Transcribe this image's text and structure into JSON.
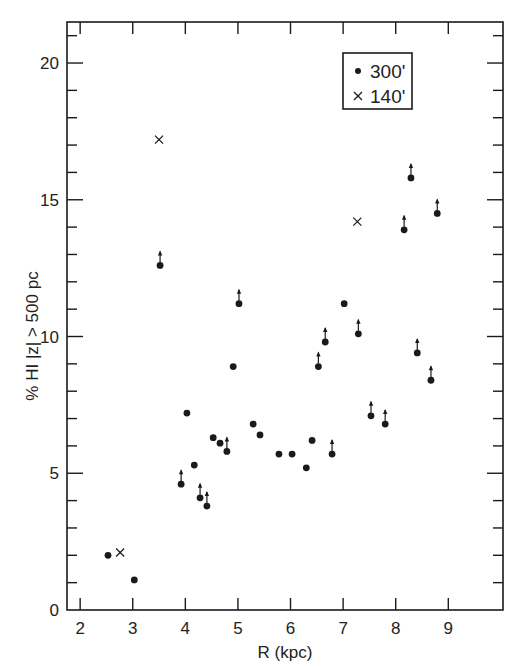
{
  "chart_data": {
    "type": "scatter",
    "title": "",
    "xlabel": "R (kpc)",
    "ylabel": "% HI |z| > 500 pc",
    "xlim": [
      1.75,
      10.04
    ],
    "ylim": [
      0,
      21.5
    ],
    "xticks": [
      2,
      3,
      4,
      5,
      6,
      7,
      8,
      9
    ],
    "yticks_major": [
      0,
      5,
      10,
      15,
      20
    ],
    "yticks_minor_step": 1,
    "grid": false,
    "legend_position": "upper right (inside)",
    "series": [
      {
        "name": "300'",
        "marker": "filled-circle",
        "points": [
          {
            "x": 2.53,
            "y": 2.0,
            "lower_limit": false
          },
          {
            "x": 3.03,
            "y": 1.1,
            "lower_limit": false
          },
          {
            "x": 3.52,
            "y": 12.6,
            "lower_limit": true
          },
          {
            "x": 3.92,
            "y": 4.6,
            "lower_limit": true
          },
          {
            "x": 4.03,
            "y": 7.2,
            "lower_limit": false
          },
          {
            "x": 4.17,
            "y": 5.3,
            "lower_limit": false
          },
          {
            "x": 4.28,
            "y": 4.1,
            "lower_limit": true
          },
          {
            "x": 4.41,
            "y": 3.8,
            "lower_limit": true
          },
          {
            "x": 4.53,
            "y": 6.3,
            "lower_limit": false
          },
          {
            "x": 4.66,
            "y": 6.1,
            "lower_limit": false
          },
          {
            "x": 4.79,
            "y": 5.8,
            "lower_limit": true
          },
          {
            "x": 4.91,
            "y": 8.9,
            "lower_limit": false
          },
          {
            "x": 5.02,
            "y": 11.2,
            "lower_limit": true
          },
          {
            "x": 5.29,
            "y": 6.8,
            "lower_limit": false
          },
          {
            "x": 5.42,
            "y": 6.4,
            "lower_limit": false
          },
          {
            "x": 5.78,
            "y": 5.7,
            "lower_limit": false
          },
          {
            "x": 6.03,
            "y": 5.7,
            "lower_limit": false
          },
          {
            "x": 6.3,
            "y": 5.2,
            "lower_limit": false
          },
          {
            "x": 6.41,
            "y": 6.2,
            "lower_limit": false
          },
          {
            "x": 6.53,
            "y": 8.9,
            "lower_limit": true
          },
          {
            "x": 6.66,
            "y": 9.8,
            "lower_limit": true
          },
          {
            "x": 6.79,
            "y": 5.7,
            "lower_limit": true
          },
          {
            "x": 7.02,
            "y": 11.2,
            "lower_limit": false
          },
          {
            "x": 7.29,
            "y": 10.1,
            "lower_limit": true
          },
          {
            "x": 7.53,
            "y": 7.1,
            "lower_limit": true
          },
          {
            "x": 7.8,
            "y": 6.8,
            "lower_limit": true
          },
          {
            "x": 8.16,
            "y": 13.9,
            "lower_limit": true
          },
          {
            "x": 8.29,
            "y": 15.8,
            "lower_limit": true
          },
          {
            "x": 8.41,
            "y": 9.4,
            "lower_limit": true
          },
          {
            "x": 8.67,
            "y": 8.4,
            "lower_limit": true
          },
          {
            "x": 8.79,
            "y": 14.5,
            "lower_limit": true
          }
        ]
      },
      {
        "name": "140'",
        "marker": "x-cross",
        "points": [
          {
            "x": 2.76,
            "y": 2.1,
            "lower_limit": false
          },
          {
            "x": 3.5,
            "y": 17.2,
            "lower_limit": false
          },
          {
            "x": 7.27,
            "y": 14.2,
            "lower_limit": false
          }
        ]
      }
    ],
    "annotations": [
      "Up-arrows on some 300' points indicate lower limits"
    ]
  },
  "legend": {
    "items": [
      {
        "symbol": "•",
        "label": "300'"
      },
      {
        "symbol": "×",
        "label": "140'"
      }
    ]
  },
  "colors": {
    "ink": "#1a1a1a",
    "background": "#ffffff"
  }
}
